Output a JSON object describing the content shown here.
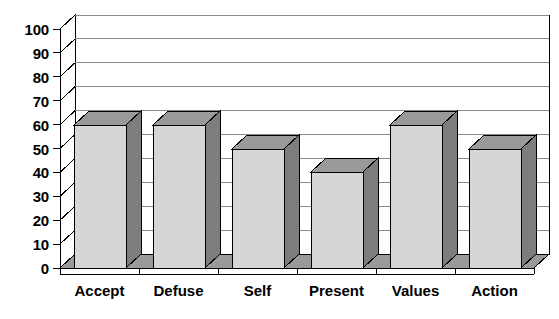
{
  "chart_data": {
    "type": "bar",
    "title": "",
    "subtitle": "",
    "xlabel": "",
    "ylabel": "",
    "categories": [
      "Accept",
      "Defuse",
      "Self",
      "Present",
      "Values",
      "Action"
    ],
    "values": [
      60,
      60,
      50,
      40,
      60,
      50
    ],
    "series": [
      {
        "name": "",
        "values": [
          60,
          60,
          50,
          40,
          60,
          50
        ]
      }
    ],
    "ylim": [
      0,
      100
    ],
    "ytick_labels": [
      "100",
      "90",
      "80",
      "70",
      "60",
      "50",
      "40",
      "30",
      "20",
      "10",
      "0"
    ],
    "ytick_values": [
      100,
      90,
      80,
      70,
      60,
      50,
      40,
      30,
      20,
      10,
      0
    ],
    "ytick_step": 10,
    "grid": true,
    "grid_axis": "y",
    "legend": false,
    "legend_position": "none",
    "annotations": [],
    "style": "3d-column",
    "colors": {
      "bar_front": "#d6d6d6",
      "bar_side": "#7d7d7d",
      "bar_top": "#9a9a9a",
      "gridline": "#8a8a8a",
      "axis": "#000000",
      "plot_background": "#ffffff",
      "floor": "#9a9a9a",
      "text": "#000000"
    }
  }
}
